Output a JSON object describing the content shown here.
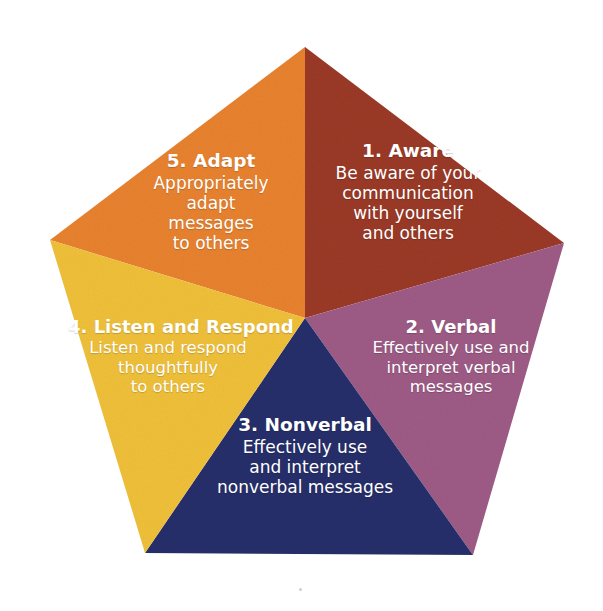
{
  "figure": {
    "background_color": "#ffffff",
    "shape": "pentagon",
    "text_color": "#ffffff"
  },
  "segments": [
    {
      "id": "aware",
      "number": "1.",
      "title": "1. Aware",
      "body": "Be aware of your\ncommunication\nwith yourself\nand others",
      "color": "#9B3A26",
      "position": "upper-right"
    },
    {
      "id": "verbal",
      "number": "2.",
      "title": "2. Verbal",
      "body": "Effectively use and\ninterpret verbal\nmessages",
      "color": "#9E5B86",
      "position": "right"
    },
    {
      "id": "nonverbal",
      "number": "3.",
      "title": "3. Nonverbal",
      "body": "Effectively use\nand interpret\nnonverbal messages",
      "color": "#26306B",
      "position": "bottom"
    },
    {
      "id": "listen",
      "number": "4.",
      "title": "4. Listen and Respond",
      "body": "Listen and respond\nthoughtfully\nto others",
      "color": "#F0C03A",
      "position": "left"
    },
    {
      "id": "adapt",
      "number": "5.",
      "title": "5. Adapt",
      "body": "Appropriately\nadapt\nmessages\nto others",
      "color": "#E8822E",
      "position": "upper-left"
    }
  ],
  "bottom_caption": {
    "text": "",
    "note_visible": false
  },
  "geometry": {
    "center_x": 305,
    "center_y": 318,
    "vertices": [
      {
        "name": "top",
        "x": 305,
        "y": 47
      },
      {
        "name": "right",
        "x": 564,
        "y": 243
      },
      {
        "name": "bottom-right",
        "x": 473,
        "y": 555
      },
      {
        "name": "bottom-left",
        "x": 145,
        "y": 553
      },
      {
        "name": "left",
        "x": 50,
        "y": 240
      }
    ]
  }
}
